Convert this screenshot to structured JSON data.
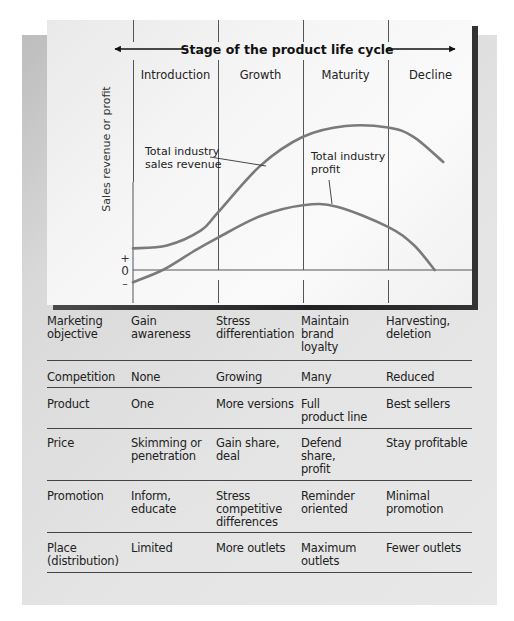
{
  "chart_data": {
    "type": "line",
    "title": "Stage of the product life cycle",
    "ylabel": "Sales revenue or profit",
    "xlabel": "",
    "y_ticks": [
      "+",
      "0",
      "–"
    ],
    "stages": [
      "Introduction",
      "Growth",
      "Maturity",
      "Decline"
    ],
    "x_domain": [
      0,
      4
    ],
    "y_domain": [
      -0.2,
      2.2
    ],
    "series": [
      {
        "name": "Total industry sales revenue",
        "label_lines": [
          "Total industry",
          "sales revenue"
        ],
        "points": [
          [
            0,
            0.3
          ],
          [
            0.4,
            0.34
          ],
          [
            0.8,
            0.55
          ],
          [
            1.0,
            0.8
          ],
          [
            1.5,
            1.45
          ],
          [
            2.0,
            1.85
          ],
          [
            2.5,
            2.0
          ],
          [
            3.0,
            1.98
          ],
          [
            3.3,
            1.85
          ],
          [
            3.65,
            1.5
          ]
        ]
      },
      {
        "name": "Total industry profit",
        "label_lines": [
          "Total industry",
          "profit"
        ],
        "points": [
          [
            0,
            -0.17
          ],
          [
            0.35,
            0.0
          ],
          [
            0.7,
            0.25
          ],
          [
            1.0,
            0.45
          ],
          [
            1.5,
            0.75
          ],
          [
            2.0,
            0.9
          ],
          [
            2.4,
            0.88
          ],
          [
            3.0,
            0.6
          ],
          [
            3.3,
            0.35
          ],
          [
            3.55,
            0.0
          ]
        ]
      }
    ],
    "grid": false,
    "legend": "inline-annotations"
  },
  "table": {
    "rows": [
      {
        "label": [
          "Marketing",
          "objective"
        ],
        "cells": [
          [
            "Gain",
            "awareness"
          ],
          [
            "Stress",
            "differentiation"
          ],
          [
            "Maintain",
            "brand",
            "loyalty"
          ],
          [
            "Harvesting,",
            "deletion"
          ]
        ]
      },
      {
        "label": [
          "Competition"
        ],
        "cells": [
          [
            "None"
          ],
          [
            "Growing"
          ],
          [
            "Many"
          ],
          [
            "Reduced"
          ]
        ]
      },
      {
        "label": [
          "Product"
        ],
        "cells": [
          [
            "One"
          ],
          [
            "More versions"
          ],
          [
            "Full",
            "product line"
          ],
          [
            "Best sellers"
          ]
        ]
      },
      {
        "label": [
          "Price"
        ],
        "cells": [
          [
            "Skimming or",
            "penetration"
          ],
          [
            "Gain share,",
            "deal"
          ],
          [
            "Defend",
            "share,",
            "profit"
          ],
          [
            "Stay profitable"
          ]
        ]
      },
      {
        "label": [
          "Promotion"
        ],
        "cells": [
          [
            "Inform,",
            "educate"
          ],
          [
            "Stress",
            "competitive",
            "differences"
          ],
          [
            "Reminder",
            "oriented"
          ],
          [
            "Minimal",
            "promotion"
          ]
        ]
      },
      {
        "label": [
          "Place",
          "(distribution)"
        ],
        "cells": [
          [
            "Limited"
          ],
          [
            "More outlets"
          ],
          [
            "Maximum",
            "outlets"
          ],
          [
            "Fewer outlets"
          ]
        ]
      }
    ]
  },
  "colors": {
    "curve": "#7a7a7a",
    "axis": "#555555",
    "text": "#222222"
  }
}
